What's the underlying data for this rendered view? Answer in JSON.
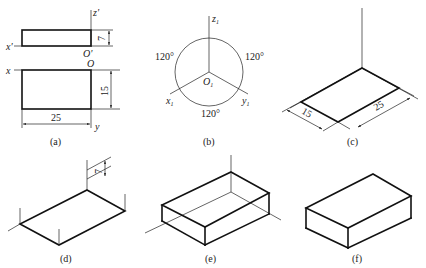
{
  "figure": {
    "panels": [
      {
        "id": "a",
        "caption": "(a)",
        "description": "Orthographic views (front and top) of a rectangular block",
        "labels": {
          "x_prime": "x'",
          "z_prime": "z'",
          "o_prime": "O'",
          "x": "x",
          "o": "O",
          "y": "y"
        },
        "dimensions": {
          "height": "7",
          "depth": "15",
          "length": "25"
        }
      },
      {
        "id": "b",
        "caption": "(b)",
        "description": "Isometric axes at 120 degrees",
        "labels": {
          "z1": "z",
          "x1": "x",
          "y1": "y",
          "o1": "O",
          "sub": "1"
        },
        "angles": [
          "120°",
          "120°",
          "120°"
        ]
      },
      {
        "id": "c",
        "caption": "(c)",
        "description": "Bottom face laid out on isometric axes",
        "dimensions": {
          "depth": "15",
          "length": "25"
        }
      },
      {
        "id": "d",
        "caption": "(d)",
        "description": "Vertical edges raised by height",
        "dimensions": {
          "height": "7"
        }
      },
      {
        "id": "e",
        "caption": "(e)",
        "description": "Box with construction lines"
      },
      {
        "id": "f",
        "caption": "(f)",
        "description": "Finished isometric box"
      }
    ]
  }
}
